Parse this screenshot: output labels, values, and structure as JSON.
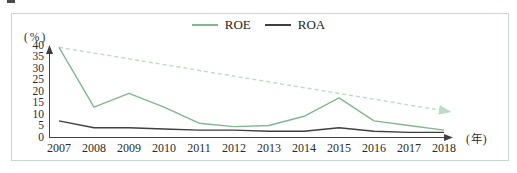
{
  "chart_data": {
    "type": "line",
    "title": "",
    "ylabel_unit": "(%)",
    "xlabel_unit": "(年)",
    "categories": [
      "2007",
      "2008",
      "2009",
      "2010",
      "2011",
      "2012",
      "2013",
      "2014",
      "2015",
      "2016",
      "2017",
      "2018"
    ],
    "series": [
      {
        "name": "ROE",
        "color": "#82b890",
        "values": [
          39,
          13,
          19,
          13,
          6,
          4.5,
          5,
          9,
          17,
          7,
          5,
          3
        ]
      },
      {
        "name": "ROA",
        "color": "#3f3f3f",
        "values": [
          7,
          4,
          4,
          3.5,
          3,
          3,
          2.5,
          2.5,
          4,
          2.5,
          2,
          2
        ]
      }
    ],
    "trendline": {
      "name": "ROE-trend",
      "color": "#bcdcc6",
      "style": "dashed",
      "from": 39,
      "to": 11
    },
    "y_ticks": [
      "40",
      "35",
      "30",
      "25",
      "20",
      "15",
      "10",
      "5",
      "0"
    ],
    "ylim": [
      0,
      40
    ],
    "grid": false,
    "legend_position": "top-center",
    "axis_color": "#3f3f3f",
    "frame_color": "#c3dbcd"
  }
}
